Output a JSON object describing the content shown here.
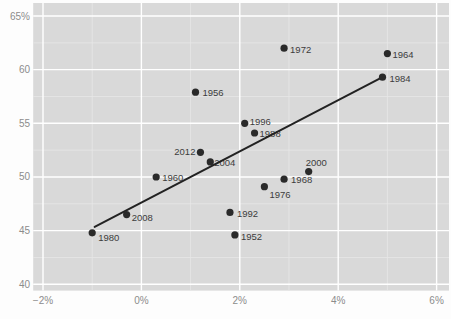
{
  "chart_data": {
    "type": "scatter",
    "title": "",
    "xlabel": "",
    "ylabel": "",
    "xlim": [
      -2.2,
      6.25
    ],
    "ylim": [
      39.4,
      66.2
    ],
    "grid": "major and minor, white on gray panel",
    "legend_position": "none",
    "x_ticks": [
      {
        "value": -2,
        "label": "−2%"
      },
      {
        "value": 0,
        "label": "0%"
      },
      {
        "value": 2,
        "label": "2%"
      },
      {
        "value": 4,
        "label": "4%"
      },
      {
        "value": 6,
        "label": "6%"
      }
    ],
    "y_ticks": [
      {
        "value": 65,
        "label": "65%"
      },
      {
        "value": 60,
        "label": "60"
      },
      {
        "value": 55,
        "label": "55"
      },
      {
        "value": 50,
        "label": "50"
      },
      {
        "value": 45,
        "label": "45"
      },
      {
        "value": 40,
        "label": "40"
      }
    ],
    "points": [
      {
        "year": "1952",
        "x": 1.9,
        "y": 44.6,
        "anchor": "start",
        "dx": 6,
        "dy": 5
      },
      {
        "year": "1956",
        "x": 1.1,
        "y": 57.9,
        "anchor": "start",
        "dx": 7,
        "dy": 4
      },
      {
        "year": "1960",
        "x": 0.3,
        "y": 50.0,
        "anchor": "start",
        "dx": 6,
        "dy": 4.5
      },
      {
        "year": "1964",
        "x": 5.0,
        "y": 61.5,
        "anchor": "start",
        "dx": 5,
        "dy": 4
      },
      {
        "year": "1968",
        "x": 2.9,
        "y": 49.8,
        "anchor": "start",
        "dx": 7,
        "dy": 4
      },
      {
        "year": "1972",
        "x": 2.9,
        "y": 62.0,
        "anchor": "start",
        "dx": 6,
        "dy": 5
      },
      {
        "year": "1976",
        "x": 2.5,
        "y": 49.1,
        "anchor": "start",
        "dx": 5,
        "dy": 11
      },
      {
        "year": "1980",
        "x": -1.0,
        "y": 44.8,
        "anchor": "start",
        "dx": 6,
        "dy": 8
      },
      {
        "year": "1984",
        "x": 4.9,
        "y": 59.3,
        "anchor": "start",
        "dx": 7,
        "dy": 4.5
      },
      {
        "year": "1988",
        "x": 2.3,
        "y": 54.1,
        "anchor": "start",
        "dx": 5,
        "dy": 4
      },
      {
        "year": "1992",
        "x": 1.8,
        "y": 46.7,
        "anchor": "start",
        "dx": 7,
        "dy": 5
      },
      {
        "year": "1996",
        "x": 2.1,
        "y": 55.0,
        "anchor": "start",
        "dx": 5,
        "dy": 2
      },
      {
        "year": "2000",
        "x": 3.4,
        "y": 50.5,
        "anchor": "start",
        "dx": -3,
        "dy": -6
      },
      {
        "year": "2004",
        "x": 1.4,
        "y": 51.4,
        "anchor": "start",
        "dx": 4,
        "dy": 4.5
      },
      {
        "year": "2008",
        "x": -0.3,
        "y": 46.5,
        "anchor": "start",
        "dx": 5,
        "dy": 6
      },
      {
        "year": "2012",
        "x": 1.2,
        "y": 52.3,
        "anchor": "end",
        "dx": -5,
        "dy": 3
      }
    ],
    "trend_line": {
      "x1": -0.95,
      "y1": 45.35,
      "x2": 4.9,
      "y2": 59.3
    },
    "colors": {
      "outer_bg": "#fdfdfd",
      "panel_bg": "#d9d9d9",
      "grid_major": "#ffffff",
      "grid_minor": "#e7e7e7",
      "point": "#2a2a2a",
      "trend": "#222222",
      "point_label": "#3c3c3c",
      "tick_label": "#8c8c8c"
    }
  }
}
